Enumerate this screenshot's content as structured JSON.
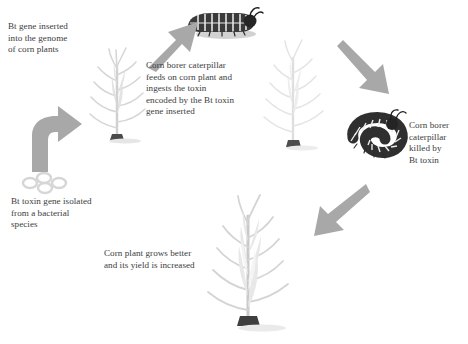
{
  "diagram": {
    "background_color": "#ffffff",
    "text_color": "#3b3b3d",
    "arrow_color": "#a3a3a3",
    "plant_color": "#d9d9d9",
    "caterpillar_color": "#2b2b2b",
    "bacteria_color": "#d7d7d7"
  },
  "captions": [
    {
      "id": "bt-gene-inserted",
      "text": "Bt gene inserted\ninto the genome\nof corn plants",
      "x": 8,
      "y": 21
    },
    {
      "id": "corn-borer-feeds",
      "text": "Corn borer caterpillar\nfeeds on corn plant and\ningests the toxin\nencoded by the Bt toxin\ngene inserted",
      "x": 146,
      "y": 60
    },
    {
      "id": "caterpillar-killed",
      "text": "Corn borer\ncaterpillar\nkilled by\nBt toxin",
      "x": 409,
      "y": 120
    },
    {
      "id": "bt-toxin-isolated",
      "text": "Bt toxin gene isolated\nfrom a bacterial\nspecies",
      "x": 11,
      "y": 196
    },
    {
      "id": "yield-increased",
      "text": "Corn plant grows better\nand its yield is increased",
      "x": 104,
      "y": 248
    }
  ],
  "objects": [
    {
      "id": "corn-plant-transgenic",
      "label": "transgenic corn plant",
      "x": 86,
      "y": 40
    },
    {
      "id": "corn-borer-caterpillar-alive",
      "label": "corn borer caterpillar feeding",
      "x": 183,
      "y": 6
    },
    {
      "id": "corn-plant-infested",
      "label": "corn plant with caterpillar",
      "x": 260,
      "y": 36
    },
    {
      "id": "corn-borer-caterpillar-dead",
      "label": "dead corn borer caterpillar",
      "x": 350,
      "y": 112
    },
    {
      "id": "corn-plant-healthy",
      "label": "healthy high-yield corn plant",
      "x": 198,
      "y": 196
    },
    {
      "id": "bacteria-cluster",
      "label": "Bacillus thuringiensis bacteria",
      "x": 22,
      "y": 172
    }
  ],
  "arrows": [
    {
      "id": "arrow-bacteria-to-plant",
      "shape": "curved-up-right",
      "from": "bacteria-cluster",
      "to": "corn-plant-transgenic"
    },
    {
      "id": "arrow-plant-to-caterpillar",
      "shape": "diagonal-up-right",
      "from": "corn-plant-transgenic",
      "to": "corn-borer-caterpillar-alive"
    },
    {
      "id": "arrow-infested-to-dead",
      "shape": "diagonal-down-right",
      "from": "corn-plant-infested",
      "to": "corn-borer-caterpillar-dead"
    },
    {
      "id": "arrow-dead-to-healthy",
      "shape": "diagonal-down-left",
      "from": "corn-borer-caterpillar-dead",
      "to": "corn-plant-healthy"
    }
  ]
}
